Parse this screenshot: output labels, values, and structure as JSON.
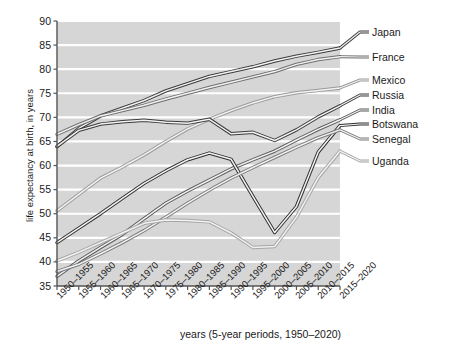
{
  "chart_data": {
    "type": "line",
    "title": "",
    "xlabel": "years (5-year periods, 1950–2020)",
    "ylabel": "life expectancy at birth, in years",
    "ylim": [
      35,
      90
    ],
    "yticks": [
      35,
      40,
      45,
      50,
      55,
      60,
      65,
      70,
      75,
      80,
      85,
      90
    ],
    "grid": "horizontal",
    "legend_position": "right-outside",
    "categories": [
      "1950–1955",
      "1955–1960",
      "1960–1965",
      "1965–1970",
      "1970–1975",
      "1975–1980",
      "1980–1985",
      "1985–1990",
      "1990–1995",
      "1995–2000",
      "2000–2005",
      "2005–2010",
      "2010–2015",
      "2015–2020"
    ],
    "series": [
      {
        "name": "Japan",
        "color": "#3a3a3a",
        "values": [
          63.9,
          67.7,
          70.3,
          71.9,
          73.5,
          75.5,
          77.0,
          78.5,
          79.5,
          80.5,
          81.7,
          82.7,
          83.5,
          84.4
        ]
      },
      {
        "name": "France",
        "color": "#6e6e6e",
        "values": [
          66.5,
          68.5,
          70.3,
          71.4,
          72.5,
          73.8,
          75.0,
          76.2,
          77.3,
          78.4,
          79.5,
          81.0,
          82.0,
          82.6
        ]
      },
      {
        "name": "Mexico",
        "color": "#9a9a9a",
        "values": [
          50.6,
          54.0,
          57.4,
          59.7,
          62.2,
          65.0,
          67.6,
          69.6,
          71.4,
          73.0,
          74.3,
          75.1,
          75.6,
          76.1
        ]
      },
      {
        "name": "Russia",
        "color": "#3a3a3a",
        "values": [
          64.0,
          67.3,
          68.6,
          69.1,
          69.4,
          69.0,
          68.8,
          69.6,
          66.6,
          66.9,
          65.2,
          67.4,
          70.1,
          72.4
        ]
      },
      {
        "name": "India",
        "color": "#5a5a5a",
        "values": [
          37.0,
          40.2,
          43.0,
          45.7,
          49.0,
          52.2,
          54.7,
          57.0,
          59.3,
          61.2,
          63.0,
          65.3,
          67.5,
          69.5
        ]
      },
      {
        "name": "Botswana",
        "color": "#2e2e2e",
        "values": [
          44.0,
          47.0,
          50.0,
          53.2,
          56.3,
          58.9,
          61.2,
          62.6,
          61.3,
          53.6,
          46.1,
          51.5,
          62.8,
          68.3
        ]
      },
      {
        "name": "Senegal",
        "color": "#7a7a7a",
        "values": [
          38.0,
          39.5,
          41.7,
          44.0,
          46.5,
          49.3,
          52.2,
          54.9,
          57.4,
          59.6,
          61.7,
          63.8,
          65.8,
          67.4
        ]
      },
      {
        "name": "Uganda",
        "color": "#a5a5a5",
        "values": [
          40.2,
          42.0,
          44.0,
          46.0,
          48.0,
          48.7,
          48.6,
          48.3,
          46.0,
          43.0,
          43.2,
          49.3,
          57.5,
          63.0
        ]
      }
    ],
    "legend_entries": [
      {
        "name": "Japan",
        "y_px": 32
      },
      {
        "name": "France",
        "y_px": 57
      },
      {
        "name": "Mexico",
        "y_px": 80
      },
      {
        "name": "Russia",
        "y_px": 95
      },
      {
        "name": "India",
        "y_px": 110
      },
      {
        "name": "Botswana",
        "y_px": 124
      },
      {
        "name": "Senegal",
        "y_px": 139
      },
      {
        "name": "Uganda",
        "y_px": 161
      }
    ],
    "colors": {
      "plot_background": "#d6d6d6",
      "gridline": "#ffffff",
      "axis": "#555555",
      "text": "#1a1a1a",
      "figure_background": "#ffffff"
    }
  }
}
